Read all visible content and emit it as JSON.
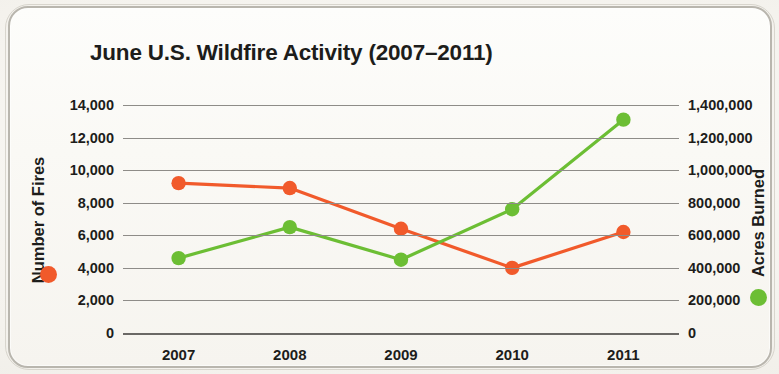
{
  "chart_data": {
    "type": "line",
    "title": "June U.S. Wildfire Activity (2007–2011)",
    "xlabel": "",
    "categories": [
      "2007",
      "2008",
      "2009",
      "2010",
      "2011"
    ],
    "grid": true,
    "legend_position": "axis-labels",
    "series": [
      {
        "name": "Number of Fires",
        "color": "#F15A2B",
        "axis": "left",
        "marker": "circle",
        "values": [
          9200,
          8900,
          6400,
          4000,
          6200
        ]
      },
      {
        "name": "Acres Burned",
        "color": "#6CBE34",
        "axis": "right",
        "marker": "circle",
        "values": [
          460000,
          650000,
          450000,
          760000,
          1310000
        ]
      }
    ],
    "left_axis": {
      "label": "Number of Fires",
      "color": "#F15A2B",
      "ylim": [
        0,
        14000
      ],
      "ticks": [
        0,
        2000,
        4000,
        6000,
        8000,
        10000,
        12000,
        14000
      ],
      "tick_labels": [
        "0",
        "2,000",
        "4,000",
        "6,000",
        "8,000",
        "10,000",
        "12,000",
        "14,000"
      ]
    },
    "right_axis": {
      "label": "Acres Burned",
      "color": "#6CBE34",
      "ylim": [
        0,
        1400000
      ],
      "ticks": [
        0,
        200000,
        400000,
        600000,
        800000,
        1000000,
        1200000,
        1400000
      ],
      "tick_labels": [
        "0",
        "200,000",
        "400,000",
        "600,000",
        "800,000",
        "1,000,000",
        "1,200,000",
        "1,400,000"
      ]
    }
  }
}
